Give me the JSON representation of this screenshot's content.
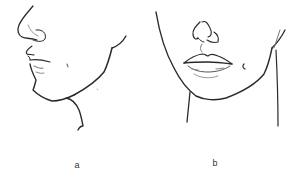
{
  "figures": [
    {
      "id": "a",
      "label": "a",
      "view": "profile view of lower face (nose, lips, chin, jaw, neck)"
    },
    {
      "id": "b",
      "label": "b",
      "view": "front view of lower face (nose, lips, chin, jaw, neck)"
    }
  ],
  "colors": {
    "stroke": "#2a2a2a",
    "shade": "#9a9a9a",
    "background": "#ffffff"
  }
}
